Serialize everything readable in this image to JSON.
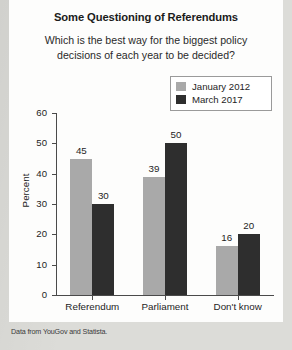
{
  "figure": {
    "title": "Some Questioning of Referendums",
    "subtitle": "Which is the best way for the biggest policy decisions of each year to be decided?",
    "source_note": "Data from YouGov and Statista."
  },
  "chart_data": {
    "type": "bar",
    "title": "Some Questioning of Referendums",
    "subtitle": "Which is the best way for the biggest policy decisions of each year to be decided?",
    "xlabel": "",
    "ylabel": "Percent",
    "ylim": [
      0,
      60
    ],
    "yticks": [
      0,
      10,
      20,
      30,
      40,
      50,
      60
    ],
    "grid": false,
    "legend_position": "top-right",
    "categories": [
      "Referendum",
      "Parliament",
      "Don't know"
    ],
    "series": [
      {
        "name": "January 2012",
        "color": "#a9a9a9",
        "values": [
          45,
          39,
          16
        ]
      },
      {
        "name": "March 2017",
        "color": "#2e2e2e",
        "values": [
          30,
          50,
          20
        ]
      }
    ],
    "annotations": [
      "Data from YouGov and Statista."
    ]
  }
}
